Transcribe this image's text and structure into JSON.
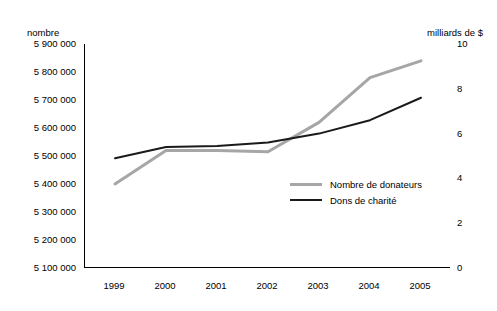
{
  "chart_data": {
    "type": "line",
    "title": "",
    "subtitle": "",
    "categories": [
      "1999",
      "2000",
      "2001",
      "2002",
      "2003",
      "2004",
      "2005"
    ],
    "x": [
      1999,
      2000,
      2001,
      2002,
      2003,
      2004,
      2005
    ],
    "left_axis": {
      "label": "nombre",
      "ticks": [
        "5 100 000",
        "5 200 000",
        "5 300 000",
        "5 400 000",
        "5 500 000",
        "5 600 000",
        "5 700 000",
        "5 800 000",
        "5 900 000"
      ],
      "tick_values": [
        5100000,
        5200000,
        5300000,
        5400000,
        5500000,
        5600000,
        5700000,
        5800000,
        5900000
      ],
      "ylim": [
        5100000,
        5900000
      ]
    },
    "right_axis": {
      "label": "milliards de $",
      "ticks": [
        "0",
        "2",
        "4",
        "6",
        "8",
        "10"
      ],
      "tick_values": [
        0,
        2,
        4,
        6,
        8,
        10
      ],
      "ylim": [
        0,
        10
      ]
    },
    "xlabel": "",
    "grid": false,
    "legend_position": "inside-center-right",
    "series": [
      {
        "name": "Nombre de donateurs",
        "axis": "left",
        "color": "#a6a6a6",
        "values": [
          5400000,
          5520000,
          5520000,
          5515000,
          5620000,
          5780000,
          5840000
        ]
      },
      {
        "name": "Dons de charité",
        "axis": "right",
        "color": "#1a1a1a",
        "values": [
          4.9,
          5.4,
          5.45,
          5.6,
          6.0,
          6.6,
          7.6
        ]
      }
    ]
  },
  "legend": {
    "items": [
      {
        "label": "Nombre de donateurs",
        "color": "#a6a6a6"
      },
      {
        "label": "Dons de charité",
        "color": "#1a1a1a"
      }
    ]
  }
}
